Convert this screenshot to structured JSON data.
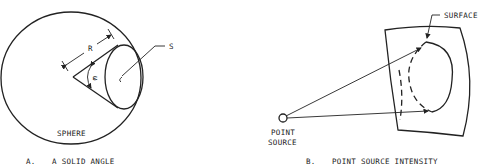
{
  "figure_a": {
    "caption_letter": "A.",
    "caption_title": "A SOLID ANGLE",
    "labels": {
      "radius": "R",
      "surface": "S",
      "angle": "ω",
      "sphere": "SPHERE"
    }
  },
  "figure_b": {
    "caption_letter": "B.",
    "caption_title": "POINT SOURCE INTENSITY",
    "labels": {
      "surface": "SURFACE",
      "point_source_line1": "POINT",
      "point_source_line2": "SOURCE"
    }
  }
}
